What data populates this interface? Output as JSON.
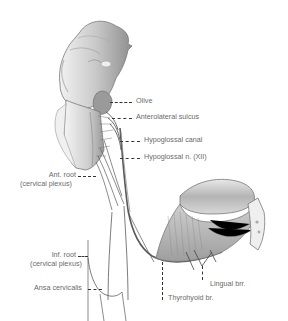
{
  "figure": {
    "labels": {
      "olive": "Olive",
      "anterolateral_sulcus": "Anterolateral sulcus",
      "hypoglossal_canal": "Hypoglossal canal",
      "hypoglossal_nerve": "Hypoglossal n. (XII)",
      "ant_root_line1": "Ant. root",
      "ant_root_line2": "(cervical plexus)",
      "inf_root_line1": "Inf. root",
      "inf_root_line2": "(cervical plexus)",
      "ansa_cervicalis": "Ansa cervicalis",
      "lingual_brr": "Lingual brr.",
      "thyrohyoid_br": "Thyrohyoid br."
    },
    "colors": {
      "background": "#ffffff",
      "label_text": "#6a6a6a",
      "leader_line": "#333333",
      "nerve": "#5a5a5a",
      "tissue_light": "#e2e2e2",
      "tissue_mid": "#b8b8b8",
      "tissue_dark": "#7a7a7a"
    }
  }
}
